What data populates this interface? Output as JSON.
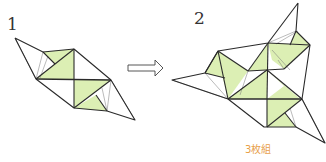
{
  "steps": [
    {
      "number": "1"
    },
    {
      "number": "2"
    }
  ],
  "caption": "3枚組",
  "colors": {
    "fill_green": "#dcefb4",
    "line": "#2a2a2a",
    "caption": "#e8a04a",
    "background": "#ffffff"
  },
  "icons": {
    "arrow": "right-outline-arrow"
  }
}
